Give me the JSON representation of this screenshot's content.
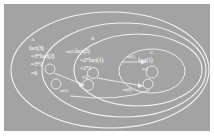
{
  "figure": {
    "background_color": "#a3a3a3",
    "stroke_color": "#f2f2f2",
    "border_color": "#ffffff"
  },
  "regions": [
    {
      "tag": "A",
      "name": "outer-frame-fact3"
    },
    {
      "tag": "B",
      "name": "middle-frame-fact2"
    },
    {
      "tag": "C",
      "name": "inner-frame-fact1"
    }
  ],
  "frames": [
    {
      "tag": "A",
      "call": "fact(3)",
      "lines": [
        "fact(3)",
        "=3*fact(2)",
        "=3*2",
        "=6"
      ]
    },
    {
      "tag": "B",
      "call": "fact(2)",
      "lines": [
        "fact(2)",
        "=2*fact(1)",
        "=2*1",
        "=2"
      ]
    },
    {
      "tag": "C",
      "call": "fact(1)",
      "lines": [
        "fact(1)",
        "=1"
      ]
    }
  ],
  "edges": [
    {
      "label": "m(2)",
      "from": "A",
      "to": "B"
    },
    {
      "label": "m(1)",
      "from": "B",
      "to": "C"
    },
    {
      "label": "m(1)",
      "from": "B",
      "to": "C"
    },
    {
      "label": "m(0)",
      "from": "C",
      "to": "B"
    }
  ]
}
